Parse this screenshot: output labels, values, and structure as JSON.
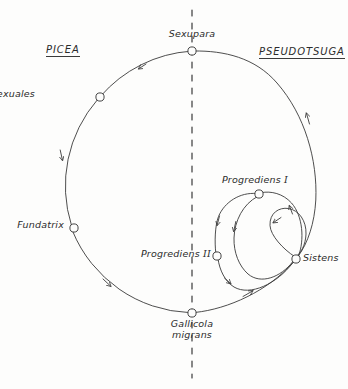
{
  "figure": {
    "kind": "life-cycle-diagram",
    "background_color": "#fdfdfc",
    "ink_color": "#3a3a3a",
    "width": 348,
    "height": 389
  },
  "hosts": {
    "left": {
      "name": "PICEA",
      "label": "PICEA",
      "underlined": true,
      "x": 46,
      "y": 50
    },
    "right": {
      "name": "PSEUDOTSUGA",
      "label": "PSEUDOTSUGA",
      "underlined": true,
      "x": 259,
      "y": 52
    }
  },
  "divider": {
    "name": "host-divider",
    "style": "dashed-vertical",
    "x": 192,
    "y_top": 10,
    "y_bottom": 378
  },
  "stages": [
    {
      "id": "sexupara",
      "label": "Sexupara",
      "x": 192,
      "y": 51,
      "label_x": 192,
      "label_y": 33,
      "label_align": "center",
      "host": "boundary"
    },
    {
      "id": "sexuales",
      "label": "Sexuales",
      "x": 100,
      "y": 97,
      "label_x": 35,
      "label_y": 91,
      "label_align": "right",
      "host": "PICEA"
    },
    {
      "id": "fundatrix",
      "label": "Fundatrix",
      "x": 74,
      "y": 228,
      "label_x": 6,
      "label_y": 222,
      "label_align": "right",
      "host": "PICEA"
    },
    {
      "id": "gallicola-migrans",
      "label": "Gallicola\nmigrans",
      "label_line1": "Gallicola",
      "label_line2": "migrans",
      "x": 192,
      "y": 313,
      "label_x": 192,
      "label_y": 318,
      "label_align": "center",
      "host": "boundary"
    },
    {
      "id": "sistens",
      "label": "Sistens",
      "x": 296,
      "y": 259,
      "label_x": 303,
      "label_y": 254,
      "label_align": "left",
      "host": "PSEUDOTSUGA"
    },
    {
      "id": "progrediens-1",
      "label": "Progrediens I",
      "label_text": "Progrediens",
      "label_numeral": "I",
      "x": 259,
      "y": 194,
      "label_x": 232,
      "label_y": 176,
      "label_align": "center",
      "host": "PSEUDOTSUGA"
    },
    {
      "id": "progrediens-2",
      "label": "Progrediens II",
      "label_text": "Progrediens",
      "label_numeral": "II",
      "x": 217,
      "y": 256,
      "label_x": 136,
      "label_y": 250,
      "label_align": "right",
      "host": "PSEUDOTSUGA"
    }
  ],
  "main_cycle": {
    "name": "main-life-cycle",
    "center_x": 185,
    "center_y": 182,
    "radius": 131,
    "direction": "counterclockwise",
    "arrow_count": 5
  },
  "inner_loops": [
    {
      "id": "sistens-to-progrediens1-loop",
      "name": "outer-inner-loop"
    },
    {
      "id": "progrediens1-to-progrediens2-loop",
      "name": "middle-inner-loop"
    },
    {
      "id": "sistens-self-loop",
      "name": "sistens-self-loop"
    }
  ]
}
